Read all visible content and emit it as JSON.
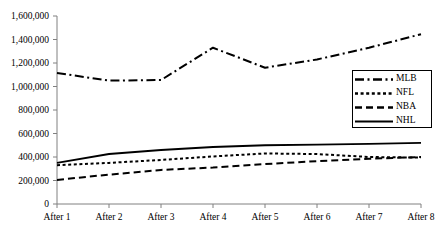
{
  "chart_data": {
    "type": "line",
    "title": "",
    "xlabel": "",
    "ylabel": "",
    "categories": [
      "After 1",
      "After 2",
      "After 3",
      "After 4",
      "After 5",
      "After 6",
      "After 7",
      "After 8"
    ],
    "ylim": [
      0,
      1600000
    ],
    "ytick_labels": [
      "1,600,000",
      "1,400,000",
      "1,200,000",
      "1,000,000",
      "800,000",
      "600,000",
      "400,000",
      "200,000",
      "0"
    ],
    "ytick_values": [
      1600000,
      1400000,
      1200000,
      1000000,
      800000,
      600000,
      400000,
      200000,
      0
    ],
    "grid": false,
    "legend_position": "right-middle",
    "series": [
      {
        "name": "MLB",
        "style": "dash-dot",
        "color": "#000000",
        "values": [
          1115000,
          1050000,
          1055000,
          1330000,
          1160000,
          1230000,
          1330000,
          1445000
        ]
      },
      {
        "name": "NFL",
        "style": "dotted",
        "color": "#000000",
        "values": [
          330000,
          350000,
          375000,
          405000,
          430000,
          425000,
          400000,
          395000
        ]
      },
      {
        "name": "NBA",
        "style": "dashed",
        "color": "#000000",
        "values": [
          205000,
          250000,
          290000,
          310000,
          340000,
          365000,
          385000,
          400000
        ]
      },
      {
        "name": "NHL",
        "style": "solid",
        "color": "#000000",
        "values": [
          350000,
          425000,
          460000,
          485000,
          500000,
          505000,
          512000,
          520000
        ]
      }
    ]
  }
}
